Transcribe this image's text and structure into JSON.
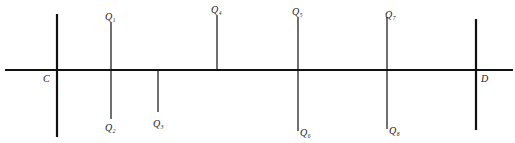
{
  "diagram": {
    "type": "line-segment-diagram",
    "baseline": {
      "x1": 5,
      "x2": 513,
      "y": 70,
      "stroke": 2.2,
      "color": "#111111"
    },
    "endpoints": [
      {
        "id": "C",
        "label": "C",
        "x": 57,
        "y1": 14,
        "y2": 137,
        "stroke": 2.2,
        "label_x": 43,
        "label_y": 82
      },
      {
        "id": "D",
        "label": "D",
        "x": 476,
        "y1": 19,
        "y2": 130,
        "stroke": 2.2,
        "label_x": 481,
        "label_y": 82
      }
    ],
    "points": [
      {
        "id": "Q1",
        "label": "Q",
        "sub": "1",
        "x": 111,
        "y1": 22,
        "y2": 70,
        "label_x": 105,
        "label_y": 20
      },
      {
        "id": "Q2",
        "label": "Q",
        "sub": "2",
        "x": 111,
        "y1": 70,
        "y2": 119,
        "label_x": 105,
        "label_y": 131
      },
      {
        "id": "Q3",
        "label": "Q",
        "sub": "3",
        "x": 158,
        "y1": 70,
        "y2": 112,
        "label_x": 153,
        "label_y": 127
      },
      {
        "id": "Q4",
        "label": "Q",
        "sub": "4",
        "x": 217,
        "y1": 15,
        "y2": 70,
        "label_x": 211,
        "label_y": 13
      },
      {
        "id": "Q5",
        "label": "Q",
        "sub": "5",
        "x": 298,
        "y1": 17,
        "y2": 70,
        "label_x": 292,
        "label_y": 15
      },
      {
        "id": "Q6",
        "label": "Q",
        "sub": "6",
        "x": 298,
        "y1": 70,
        "y2": 131,
        "label_x": 300,
        "label_y": 136
      },
      {
        "id": "Q7",
        "label": "Q",
        "sub": "7",
        "x": 387,
        "y1": 17,
        "y2": 70,
        "label_x": 385,
        "label_y": 18
      },
      {
        "id": "Q8",
        "label": "Q",
        "sub": "8",
        "x": 387,
        "y1": 70,
        "y2": 129,
        "label_x": 389,
        "label_y": 134
      }
    ]
  }
}
